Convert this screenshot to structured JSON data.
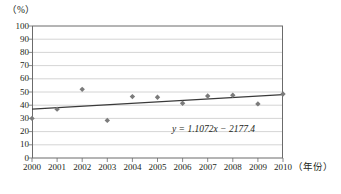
{
  "chart_data": {
    "type": "scatter",
    "title": "",
    "xlabel": "（年份）",
    "ylabel": "（%）",
    "x": [
      2000,
      2001,
      2002,
      2003,
      2004,
      2005,
      2006,
      2007,
      2008,
      2009,
      2010
    ],
    "categories": [
      "2000",
      "2001",
      "2002",
      "2003",
      "2004",
      "2005",
      "2006",
      "2007",
      "2008",
      "2009",
      "2010"
    ],
    "values": [
      30,
      37,
      52,
      28.5,
      46.5,
      46,
      41.5,
      47,
      47.5,
      41,
      48.5
    ],
    "series": [
      {
        "name": "data-points",
        "marker": "diamond",
        "color": "#7b7b7b",
        "values": [
          30,
          37,
          52,
          28.5,
          46.5,
          46,
          41.5,
          47,
          47.5,
          41,
          48.5
        ]
      },
      {
        "name": "trendline",
        "type": "line",
        "color": "#3a3a3a",
        "equation": "y = 1.1072x − 2177.4",
        "slope": 1.1072,
        "intercept": -2177.4,
        "endpoints": [
          {
            "x": 2000,
            "y": 36.99
          },
          {
            "x": 2010,
            "y": 48.07
          }
        ]
      }
    ],
    "annotations": [
      {
        "name": "regression-equation",
        "text": "y = 1.1072x − 2177.4"
      }
    ],
    "xlim": [
      2000,
      2010
    ],
    "ylim": [
      0,
      100
    ],
    "ytick_labels": [
      "100",
      "90",
      "80",
      "70",
      "60",
      "50",
      "40",
      "30",
      "20",
      "10",
      "0"
    ],
    "ytick_values": [
      100,
      90,
      80,
      70,
      60,
      50,
      40,
      30,
      20,
      10,
      0
    ],
    "xtick_labels": [
      "2000",
      "2001",
      "2002",
      "2003",
      "2004",
      "2005",
      "2006",
      "2007",
      "2008",
      "2009",
      "2010"
    ],
    "grid": "horizontal",
    "legend": "none",
    "gridline_color": "#c9c9c9",
    "axis_color": "#6b6b6b",
    "marker_color": "#7b7b7b",
    "trendline_color": "#3a3a3a"
  },
  "axes": {
    "y_unit": "（%）",
    "x_unit": "（年份）"
  },
  "equation": {
    "text": "y = 1.1072x − 2177.4"
  }
}
